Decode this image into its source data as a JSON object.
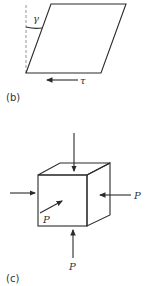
{
  "figure_b": {
    "label": "(b)",
    "shape": "parallelogram (sheared square)",
    "angle_symbol": "γ",
    "stress_symbol": "τ",
    "arrow_direction": "left"
  },
  "figure_c": {
    "label": "(c)",
    "shape": "cube under hydrostatic pressure",
    "force_labels": [
      "P",
      "P",
      "P"
    ],
    "arrows": [
      "top-down",
      "left-to-right",
      "right-to-left",
      "bottom-up",
      "front-diagonal"
    ]
  },
  "colors": {
    "line": "#2b2b2b",
    "dashed": "#888888",
    "background": "#ffffff"
  }
}
